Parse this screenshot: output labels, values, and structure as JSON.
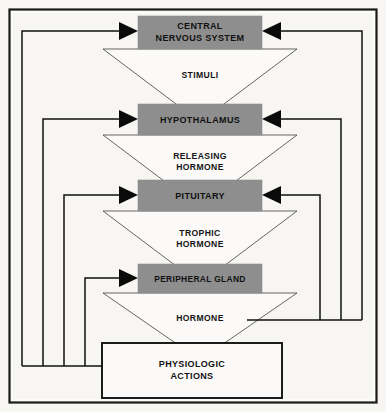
{
  "diagram": {
    "canvas": {
      "width": 386,
      "height": 412
    },
    "colors": {
      "node_fill": "#8e8e8e",
      "background": "#f7f6f3",
      "stroke": "#111111",
      "triangle_fill": "#fbfaf8",
      "frame": "#1a1a1a"
    },
    "nodes": [
      {
        "id": "cns",
        "line1": "CENTRAL",
        "line2": "NERVOUS SYSTEM",
        "style": "gray-box"
      },
      {
        "id": "hypothalamus",
        "line1": "HYPOTHALAMUS",
        "line2": "",
        "style": "gray-box"
      },
      {
        "id": "pituitary",
        "line1": "PITUITARY",
        "line2": "",
        "style": "gray-box"
      },
      {
        "id": "peripheral_gland",
        "line1": "PERIPHERAL GLAND",
        "line2": "",
        "style": "gray-box"
      }
    ],
    "sink": {
      "id": "physiologic_actions",
      "line1": "PHYSIOLOGIC",
      "line2": "ACTIONS",
      "style": "white-box"
    },
    "flows": [
      {
        "id": "stimuli",
        "from": "cns",
        "to": "hypothalamus",
        "line1": "STIMULI",
        "line2": ""
      },
      {
        "id": "releasing_hormone",
        "from": "hypothalamus",
        "to": "pituitary",
        "line1": "RELEASING",
        "line2": "HORMONE"
      },
      {
        "id": "trophic_hormone",
        "from": "pituitary",
        "to": "peripheral_gland",
        "line1": "TROPHIC",
        "line2": "HORMONE"
      },
      {
        "id": "hormone",
        "from": "peripheral_gland",
        "to": "physiologic_actions",
        "line1": "HORMONE",
        "line2": ""
      }
    ],
    "feedback_left": [
      {
        "id": "fb-left-cns",
        "source": "physiologic_actions",
        "target": "cns"
      },
      {
        "id": "fb-left-hypothalamus",
        "source": "physiologic_actions",
        "target": "hypothalamus"
      },
      {
        "id": "fb-left-pituitary",
        "source": "physiologic_actions",
        "target": "pituitary"
      },
      {
        "id": "fb-left-peripheral-gland",
        "source": "physiologic_actions",
        "target": "peripheral_gland"
      }
    ],
    "feedback_right": [
      {
        "id": "fb-right-cns",
        "source": "hormone",
        "target": "cns"
      },
      {
        "id": "fb-right-hypothalamus",
        "source": "hormone",
        "target": "hypothalamus"
      },
      {
        "id": "fb-right-pituitary",
        "source": "hormone",
        "target": "pituitary"
      }
    ]
  }
}
